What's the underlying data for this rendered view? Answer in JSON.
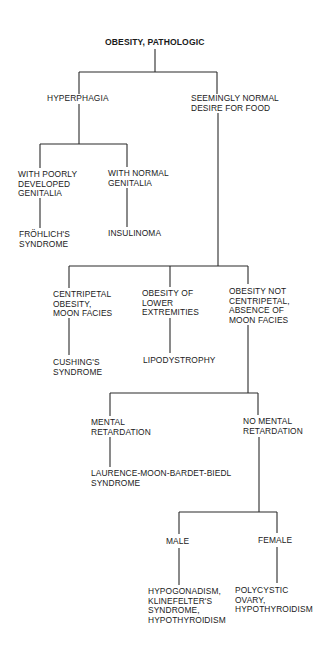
{
  "diagram": {
    "title": "OBESITY, PATHOLOGIC",
    "nodes": {
      "hyperphagia": "HYPERPHAGIA",
      "normal_desire": "SEEMINGLY NORMAL\nDESIRE FOR FOOD",
      "poor_genitalia": "WITH POORLY\nDEVELOPED\nGENITALIA",
      "normal_genitalia": "WITH NORMAL\nGENITALIA",
      "frohlich": "FRÖHLICH'S\nSYNDROME",
      "insulinoma": "INSULINOMA",
      "centripetal": "CENTRIPETAL\nOBESITY,\nMOON FACIES",
      "lower_extremities": "OBESITY OF\nLOWER\nEXTREMITIES",
      "not_centripetal": "OBESITY NOT\nCENTRIPETAL,\nABSENCE OF\nMOON FACIES",
      "cushing": "CUSHING'S\nSYNDROME",
      "lipodystrophy": "LIPODYSTROPHY",
      "mental_retardation": "MENTAL\nRETARDATION",
      "no_mental_retardation": "NO MENTAL\nRETARDATION",
      "laurence": "LAURENCE-MOON-BARDET-BIEDL\nSYNDROME",
      "male": "MALE",
      "female": "FEMALE",
      "male_dx": "HYPOGONADISM,\nKLINEFELTER'S\nSYNDROME,\nHYPOTHYROIDISM",
      "female_dx": "POLYCYSTIC\nOVARY,\nHYPOTHYROIDISM"
    },
    "edges": [
      [
        "title",
        "hyperphagia"
      ],
      [
        "title",
        "normal_desire"
      ],
      [
        "hyperphagia",
        "poor_genitalia"
      ],
      [
        "hyperphagia",
        "normal_genitalia"
      ],
      [
        "poor_genitalia",
        "frohlich"
      ],
      [
        "normal_genitalia",
        "insulinoma"
      ],
      [
        "normal_desire",
        "centripetal"
      ],
      [
        "normal_desire",
        "lower_extremities"
      ],
      [
        "normal_desire",
        "not_centripetal"
      ],
      [
        "centripetal",
        "cushing"
      ],
      [
        "lower_extremities",
        "lipodystrophy"
      ],
      [
        "not_centripetal",
        "mental_retardation"
      ],
      [
        "not_centripetal",
        "no_mental_retardation"
      ],
      [
        "mental_retardation",
        "laurence"
      ],
      [
        "no_mental_retardation",
        "male"
      ],
      [
        "no_mental_retardation",
        "female"
      ],
      [
        "male",
        "male_dx"
      ],
      [
        "female",
        "female_dx"
      ]
    ]
  }
}
